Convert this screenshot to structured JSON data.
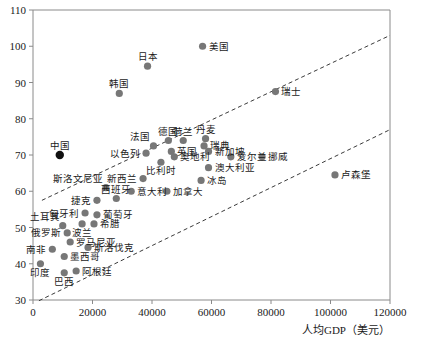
{
  "chart_data": {
    "type": "scatter",
    "title": "",
    "xlabel": "人均GDP（美元）",
    "ylabel": "",
    "xlim": [
      0,
      120000
    ],
    "ylim": [
      30,
      110
    ],
    "xticks": [
      0,
      20000,
      40000,
      60000,
      80000,
      100000,
      120000
    ],
    "xtick_labels": [
      "0",
      "20000",
      "40000",
      "60000",
      "80000",
      "100000",
      "120000"
    ],
    "yticks": [
      30,
      40,
      50,
      60,
      70,
      80,
      90,
      100,
      110
    ],
    "ytick_labels": [
      "30",
      "40",
      "50",
      "60",
      "70",
      "80",
      "90",
      "100",
      "110"
    ],
    "grid": false,
    "legend": "none",
    "point_color": "#777777",
    "highlight_color": "#111111",
    "trendline_color": "#3a3a3a",
    "trendlines": [
      {
        "name": "upper-bound",
        "x": [
          3000,
          120000
        ],
        "y": [
          57.5,
          103.0
        ],
        "style": "dashed"
      },
      {
        "name": "lower-bound",
        "x": [
          2000,
          120000
        ],
        "y": [
          29.8,
          77.0
        ],
        "style": "dashed"
      }
    ],
    "points": [
      {
        "label": "美国",
        "x": 57000,
        "y": 100.0,
        "label_pos": "right",
        "highlight": false
      },
      {
        "label": "日本",
        "x": 38500,
        "y": 94.5,
        "label_pos": "above",
        "highlight": false
      },
      {
        "label": "韩国",
        "x": 29000,
        "y": 87.0,
        "label_pos": "above",
        "highlight": false
      },
      {
        "label": "瑞士",
        "x": 81500,
        "y": 87.5,
        "label_pos": "right",
        "highlight": false
      },
      {
        "label": "中国",
        "x": 9000,
        "y": 70.0,
        "label_pos": "above",
        "highlight": true
      },
      {
        "label": "法国",
        "x": 40500,
        "y": 72.5,
        "label_pos": "above-left",
        "highlight": false
      },
      {
        "label": "德国",
        "x": 45500,
        "y": 74.0,
        "label_pos": "above",
        "highlight": false
      },
      {
        "label": "荷兰",
        "x": 50500,
        "y": 74.0,
        "label_pos": "above",
        "highlight": false
      },
      {
        "label": "丹麦",
        "x": 58000,
        "y": 74.5,
        "label_pos": "above",
        "highlight": false
      },
      {
        "label": "瑞典",
        "x": 57500,
        "y": 72.5,
        "label_pos": "right",
        "highlight": false
      },
      {
        "label": "英国",
        "x": 46500,
        "y": 71.0,
        "label_pos": "right",
        "highlight": false
      },
      {
        "label": "新加坡",
        "x": 59000,
        "y": 71.0,
        "label_pos": "right",
        "highlight": false
      },
      {
        "label": "奥地利",
        "x": 47500,
        "y": 69.5,
        "label_pos": "right",
        "highlight": false
      },
      {
        "label": "爱尔兰",
        "x": 66500,
        "y": 69.5,
        "label_pos": "right",
        "highlight": false
      },
      {
        "label": "挪威",
        "x": 77000,
        "y": 69.5,
        "label_pos": "right",
        "highlight": false
      },
      {
        "label": "以色列",
        "x": 38000,
        "y": 70.5,
        "label_pos": "left",
        "highlight": false
      },
      {
        "label": "比利时",
        "x": 43000,
        "y": 68.0,
        "label_pos": "below",
        "highlight": false
      },
      {
        "label": "澳大利亚",
        "x": 59000,
        "y": 66.5,
        "label_pos": "right",
        "highlight": false
      },
      {
        "label": "冰岛",
        "x": 56500,
        "y": 63.0,
        "label_pos": "right",
        "highlight": false
      },
      {
        "label": "新西兰",
        "x": 37000,
        "y": 63.5,
        "label_pos": "left",
        "highlight": false
      },
      {
        "label": "斯洛文尼亚",
        "x": 24500,
        "y": 61.0,
        "label_pos": "above-left",
        "highlight": false
      },
      {
        "label": "意大利",
        "x": 33000,
        "y": 60.0,
        "label_pos": "right",
        "highlight": false
      },
      {
        "label": "加拿大",
        "x": 45000,
        "y": 60.0,
        "label_pos": "right",
        "highlight": false
      },
      {
        "label": "西班牙",
        "x": 28000,
        "y": 58.0,
        "label_pos": "above",
        "highlight": false
      },
      {
        "label": "捷克",
        "x": 21500,
        "y": 57.5,
        "label_pos": "left",
        "highlight": false
      },
      {
        "label": "匈牙利",
        "x": 17500,
        "y": 54.0,
        "label_pos": "left",
        "highlight": false
      },
      {
        "label": "葡萄牙",
        "x": 21500,
        "y": 53.5,
        "label_pos": "right",
        "highlight": false
      },
      {
        "label": "波兰",
        "x": 16500,
        "y": 51.0,
        "label_pos": "below",
        "highlight": false
      },
      {
        "label": "希腊",
        "x": 20500,
        "y": 51.0,
        "label_pos": "right",
        "highlight": false
      },
      {
        "label": "土耳其",
        "x": 10000,
        "y": 50.5,
        "label_pos": "above-left",
        "highlight": false
      },
      {
        "label": "俄罗斯",
        "x": 11500,
        "y": 48.5,
        "label_pos": "left",
        "highlight": false
      },
      {
        "label": "罗马尼亚",
        "x": 12500,
        "y": 46.0,
        "label_pos": "right",
        "highlight": false
      },
      {
        "label": "斯洛伐克",
        "x": 18500,
        "y": 44.5,
        "label_pos": "right",
        "highlight": false
      },
      {
        "label": "南非",
        "x": 6500,
        "y": 44.0,
        "label_pos": "left",
        "highlight": false
      },
      {
        "label": "墨西哥",
        "x": 10500,
        "y": 42.0,
        "label_pos": "right",
        "highlight": false
      },
      {
        "label": "印度",
        "x": 2500,
        "y": 40.0,
        "label_pos": "below",
        "highlight": false
      },
      {
        "label": "巴西",
        "x": 10500,
        "y": 37.5,
        "label_pos": "below",
        "highlight": false
      },
      {
        "label": "阿根廷",
        "x": 14500,
        "y": 38.0,
        "label_pos": "right",
        "highlight": false
      },
      {
        "label": "卢森堡",
        "x": 101500,
        "y": 64.5,
        "label_pos": "right",
        "highlight": false
      }
    ]
  },
  "axis": {
    "x_title": "人均GDP（美元）"
  }
}
